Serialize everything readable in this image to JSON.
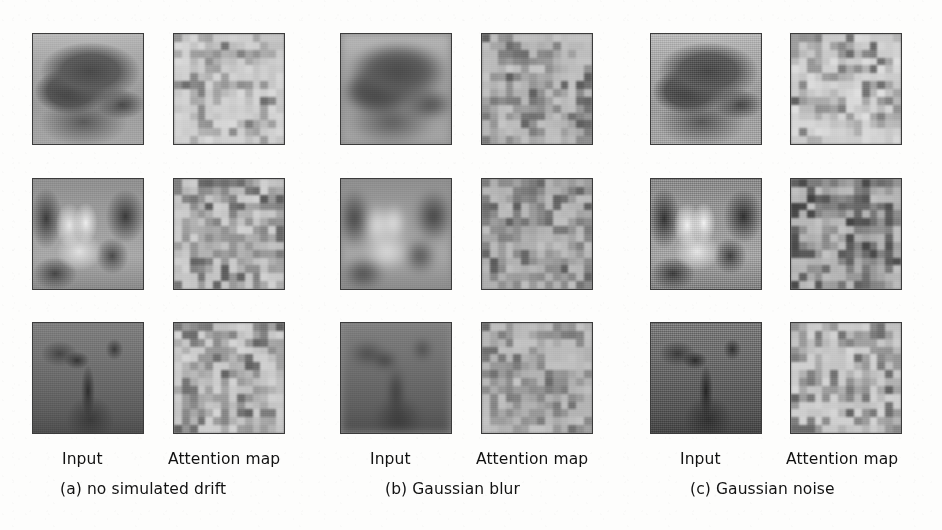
{
  "figure": {
    "background_color": "#fdfdfc",
    "border_color": "#3b3b3b",
    "columns_labels": {
      "input": "Input",
      "attention_map": "Attention map"
    },
    "panels": [
      {
        "key": "a",
        "caption": "(a) no simulated drift",
        "condition": "none",
        "input_label": "Input",
        "attention_label": "Attention map"
      },
      {
        "key": "b",
        "caption": "(b) Gaussian blur",
        "condition": "blur",
        "input_label": "Input",
        "attention_label": "Attention map"
      },
      {
        "key": "c",
        "caption": "(c) Gaussian noise",
        "condition": "noise",
        "input_label": "Input",
        "attention_label": "Attention map"
      }
    ],
    "rows": [
      {
        "index": 0,
        "subject": "bison-side-view"
      },
      {
        "index": 1,
        "subject": "animal-frontal-bright"
      },
      {
        "index": 2,
        "subject": "deer-face-dark"
      }
    ],
    "grid": {
      "tile_size_px": 112,
      "rows": 3,
      "columns": 6,
      "column_x": [
        32,
        173,
        340,
        481,
        650,
        790
      ],
      "row_y": [
        33,
        178,
        322
      ],
      "attention_cells": 14
    },
    "chart_data": {
      "type": "heatmap",
      "title": "",
      "note": "Qualitative grid: paired input image and 14x14 attention map per drift condition",
      "series": [
        {
          "name": "(a) no simulated drift / row 1 attention",
          "values": [
            [
              0.82,
              0.78,
              0.62,
              0.58,
              0.7,
              0.86,
              0.9,
              0.66,
              0.55,
              0.72,
              0.88,
              0.84,
              0.6,
              0.52
            ],
            [
              0.74,
              0.55,
              0.5,
              0.68,
              0.92,
              0.88,
              0.62,
              0.58,
              0.8,
              0.9,
              0.7,
              0.54,
              0.62,
              0.5
            ],
            [
              0.58,
              0.52,
              0.7,
              0.9,
              0.86,
              0.6,
              0.55,
              0.74,
              0.92,
              0.84,
              0.58,
              0.5,
              0.68,
              0.58
            ],
            [
              0.66,
              0.72,
              0.88,
              0.84,
              0.58,
              0.52,
              0.7,
              0.9,
              0.86,
              0.62,
              0.54,
              0.72,
              0.88,
              0.66
            ],
            [
              0.84,
              0.9,
              0.7,
              0.56,
              0.62,
              0.78,
              0.92,
              0.86,
              0.6,
              0.52,
              0.74,
              0.9,
              0.8,
              0.58
            ],
            [
              0.92,
              0.72,
              0.54,
              0.66,
              0.88,
              0.9,
              0.72,
              0.56,
              0.64,
              0.86,
              0.92,
              0.68,
              0.54,
              0.7
            ],
            [
              0.7,
              0.56,
              0.72,
              0.92,
              0.86,
              0.62,
              0.54,
              0.78,
              0.9,
              0.84,
              0.58,
              0.52,
              0.76,
              0.9
            ],
            [
              0.88,
              0.92,
              0.86,
              0.6,
              0.54,
              0.76,
              0.92,
              0.88,
              0.62,
              0.56,
              0.8,
              0.92,
              0.86,
              0.64
            ],
            [
              0.9,
              0.84,
              0.58,
              0.52,
              0.78,
              0.92,
              0.86,
              0.6,
              0.54,
              0.82,
              0.94,
              0.88,
              0.62,
              0.56
            ],
            [
              0.86,
              0.62,
              0.54,
              0.8,
              0.94,
              0.88,
              0.64,
              0.56,
              0.84,
              0.94,
              0.86,
              0.6,
              0.54,
              0.8
            ],
            [
              0.6,
              0.56,
              0.84,
              0.94,
              0.88,
              0.62,
              0.58,
              0.86,
              0.94,
              0.86,
              0.62,
              0.56,
              0.82,
              0.94
            ],
            [
              0.58,
              0.86,
              0.94,
              0.88,
              0.64,
              0.58,
              0.88,
              0.94,
              0.86,
              0.6,
              0.56,
              0.84,
              0.94,
              0.88
            ],
            [
              0.88,
              0.94,
              0.86,
              0.62,
              0.58,
              0.88,
              0.94,
              0.84,
              0.62,
              0.58,
              0.86,
              0.94,
              0.86,
              0.62
            ],
            [
              0.94,
              0.86,
              0.62,
              0.58,
              0.88,
              0.94,
              0.84,
              0.6,
              0.58,
              0.88,
              0.94,
              0.86,
              0.6,
              0.58
            ]
          ]
        }
      ],
      "colormap": "grayscale",
      "vmin": 0,
      "vmax": 1
    }
  }
}
